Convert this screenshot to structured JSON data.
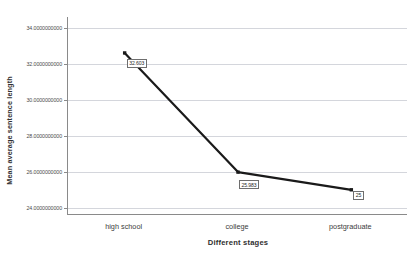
{
  "chart_data": {
    "type": "line",
    "title": "",
    "xlabel": "Different stages",
    "ylabel": "Mean average sentence length",
    "categories": [
      "high school",
      "college",
      "postgraduate"
    ],
    "values": [
      32.603,
      25.983,
      25.0
    ],
    "point_labels": [
      "32.603",
      "25.983",
      "25"
    ],
    "ylim": [
      23.6,
      34.6
    ],
    "yticks": [
      24,
      26,
      28,
      30,
      32,
      34
    ],
    "ytick_labels": [
      "24.0000000000",
      "26.0000000000",
      "28.0000000000",
      "30.0000000000",
      "32.0000000000",
      "34.0000000000"
    ],
    "grid": true,
    "legend": "none",
    "series_color": "#1a1a1a",
    "gridline_color": "#d4d6dc",
    "axis_color": "#8a8a8a",
    "marker": "square"
  }
}
